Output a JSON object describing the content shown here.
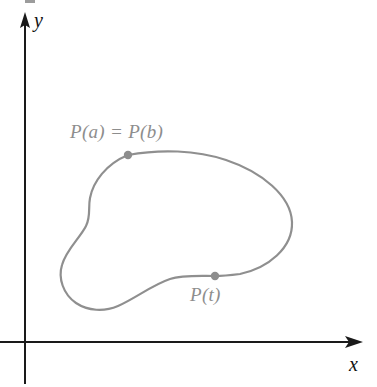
{
  "figure": {
    "kind": "math-diagram",
    "background_color": "#ffffff",
    "axes": {
      "color": "#1a1a1a",
      "stroke_width": 2,
      "origin": {
        "x": 25,
        "y": 342
      },
      "y_axis": {
        "label": "y",
        "arrow_tip": {
          "x": 25,
          "y": 13
        },
        "bottom": {
          "x": 25,
          "y": 384
        }
      },
      "x_axis": {
        "label": "x",
        "arrow_tip": {
          "x": 362,
          "y": 342
        },
        "left": {
          "x": 0,
          "y": 342
        }
      }
    },
    "curve": {
      "color": "#8f8f8f",
      "stroke_width": 2.2,
      "closed": true,
      "label_color": "#8d8d8d",
      "marker_color": "#8d8d8d",
      "marker_radius": 4.2
    },
    "labels": {
      "y_axis": "y",
      "x_axis": "x",
      "point_start_end": "P(a) = P(b)",
      "point_t": "P(t)"
    },
    "points": [
      {
        "name": "P(a) = P(b)",
        "x": 128,
        "y": 155
      },
      {
        "name": "P(t)",
        "x": 215,
        "y": 276
      }
    ]
  }
}
